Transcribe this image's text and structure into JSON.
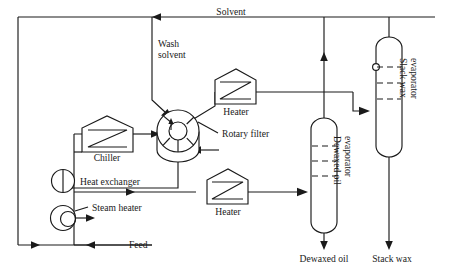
{
  "diagram": {
    "type": "process-flow-diagram",
    "colors": {
      "line": "#1a1a1a",
      "background": "#ffffff"
    },
    "streams": [
      {
        "id": "solvent",
        "label": "Solvent"
      },
      {
        "id": "wash_solvent",
        "label": "Wash\nsolvent"
      },
      {
        "id": "wash_solvent_line1",
        "label": "Wash"
      },
      {
        "id": "wash_solvent_line2",
        "label": "solvent"
      },
      {
        "id": "feed",
        "label": "Feed"
      },
      {
        "id": "dewaxed_oil",
        "label": "Dewaxed oil"
      },
      {
        "id": "stack_wax",
        "label": "Stack wax"
      }
    ],
    "equipment": [
      {
        "id": "chiller",
        "label": "Chiller",
        "symbol": "pentagon-exchanger"
      },
      {
        "id": "heat_exchanger",
        "label": "Heat exchanger",
        "symbol": "circle-arrow"
      },
      {
        "id": "steam_heater",
        "label": "Steam heater",
        "symbol": "double-circle"
      },
      {
        "id": "rotary_filter",
        "label": "Rotary filter",
        "symbol": "rotary-drum"
      },
      {
        "id": "heater_top",
        "label": "Heater",
        "symbol": "pentagon-exchanger"
      },
      {
        "id": "heater_bottom",
        "label": "Heater",
        "symbol": "pentagon-exchanger"
      },
      {
        "id": "dewaxed_oil_evaporator",
        "label": "Dewaxed oil\nevaporator",
        "symbol": "vertical-vessel"
      },
      {
        "id": "dewaxed_oil_evaporator_line1",
        "label": "Dewaxed oil"
      },
      {
        "id": "dewaxed_oil_evaporator_line2",
        "label": "evaporator"
      },
      {
        "id": "slack_wax_evaporator",
        "label": "Slack wax\nevaporator",
        "symbol": "vertical-vessel"
      },
      {
        "id": "slack_wax_evaporator_line1",
        "label": "Slack wax"
      },
      {
        "id": "slack_wax_evaporator_line2",
        "label": "evaporator"
      }
    ]
  }
}
